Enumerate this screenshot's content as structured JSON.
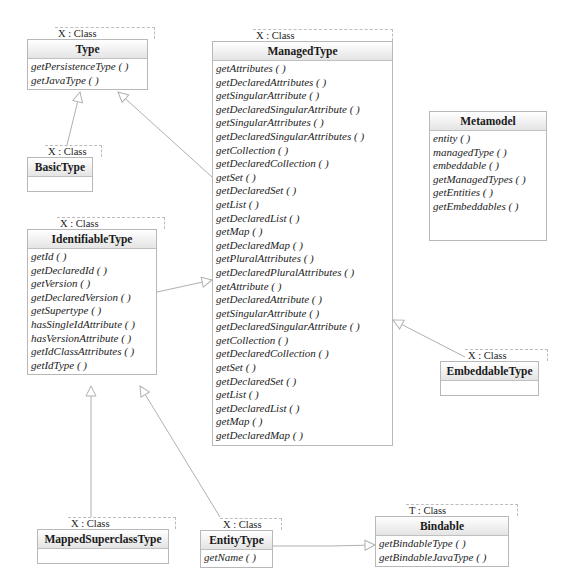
{
  "diagram": {
    "template_suffix": ": Class",
    "classes": {
      "type": {
        "template_param": "X : Class",
        "name": "Type",
        "operations": [
          "getPersistenceType ( )",
          "getJavaType ( )"
        ]
      },
      "managed_type": {
        "template_param": "X : Class",
        "name": "ManagedType",
        "operations": [
          "getAttributes ( )",
          "getDeclaredAttributes ( )",
          "getSingularAttribute ( )",
          "getDeclaredSingularAttribute ( )",
          "getSingularAttributes ( )",
          "getDeclaredSingularAttributes ( )",
          "getCollection ( )",
          "getDeclaredCollection ( )",
          "getSet ( )",
          "getDeclaredSet ( )",
          "getList ( )",
          "getDeclaredList ( )",
          "getMap ( )",
          "getDeclaredMap ( )",
          "getPluralAttributes ( )",
          "getDeclaredPluralAttributes ( )",
          "getAttribute ( )",
          "getDeclaredAttribute ( )",
          "getSingularAttribute ( )",
          "getDeclaredSingularAttribute ( )",
          "getCollection ( )",
          "getDeclaredCollection ( )",
          "getSet ( )",
          "getDeclaredSet ( )",
          "getList ( )",
          "getDeclaredList ( )",
          "getMap ( )",
          "getDeclaredMap ( )"
        ]
      },
      "metamodel": {
        "name": "Metamodel",
        "operations": [
          "entity ( )",
          "managedType ( )",
          "embeddable ( )",
          "getManagedTypes ( )",
          "getEntities ( )",
          "getEmbeddables ( )"
        ]
      },
      "basic_type": {
        "template_param": "X : Class",
        "name": "BasicType",
        "operations": []
      },
      "identifiable_type": {
        "template_param": "X : Class",
        "name": "IdentifiableType",
        "operations": [
          "getId ( )",
          "getDeclaredId ( )",
          "getVersion ( )",
          "getDeclaredVersion ( )",
          "getSupertype ( )",
          "hasSingleIdAttribute ( )",
          "hasVersionAttribute ( )",
          "getIdClassAttributes ( )",
          "getIdType ( )"
        ]
      },
      "embeddable_type": {
        "template_param": "X : Class",
        "name": "EmbeddableType",
        "operations": []
      },
      "mapped_superclass_type": {
        "template_param": "X : Class",
        "name": "MappedSuperclassType",
        "operations": []
      },
      "entity_type": {
        "template_param": "X : Class",
        "name": "EntityType",
        "operations": [
          "getName ( )"
        ]
      },
      "bindable": {
        "template_param": "T : Class",
        "name": "Bindable",
        "operations": [
          "getBindableType ( )",
          "getBindableJavaType ( )"
        ]
      }
    },
    "relationships": [
      {
        "kind": "generalization",
        "from": "BasicType",
        "to": "Type"
      },
      {
        "kind": "generalization",
        "from": "ManagedType",
        "to": "Type"
      },
      {
        "kind": "generalization",
        "from": "IdentifiableType",
        "to": "ManagedType"
      },
      {
        "kind": "generalization",
        "from": "EmbeddableType",
        "to": "ManagedType"
      },
      {
        "kind": "generalization",
        "from": "MappedSuperclassType",
        "to": "IdentifiableType"
      },
      {
        "kind": "generalization",
        "from": "EntityType",
        "to": "IdentifiableType"
      },
      {
        "kind": "realization",
        "from": "EntityType",
        "to": "Bindable"
      }
    ]
  }
}
